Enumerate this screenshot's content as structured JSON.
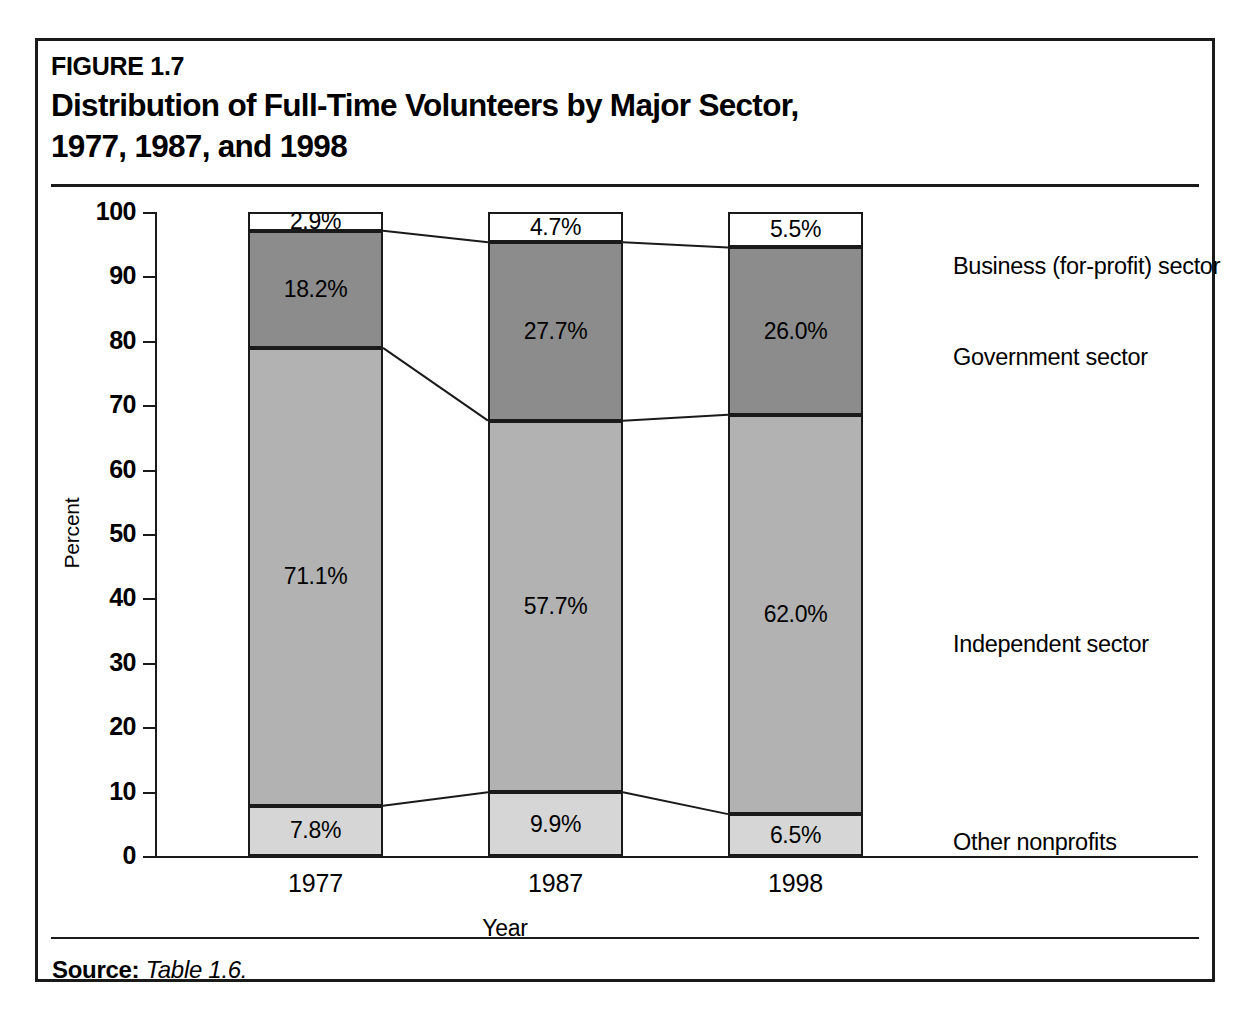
{
  "figure": {
    "number": "FIGURE 1.7",
    "title": "Distribution of Full-Time Volunteers by Major Sector, 1977, 1987, and 1998",
    "title_line1": "Distribution of Full-Time Volunteers by Major Sector,",
    "title_line2": "1977, 1987, and 1998",
    "source_label": "Source:",
    "source_value": "Table 1.6."
  },
  "chart_data": {
    "type": "bar",
    "subtype": "stacked-100-percent",
    "title": "Distribution of Full-Time Volunteers by Major Sector, 1977, 1987, and 1998",
    "xlabel": "Year",
    "ylabel": "Percent",
    "categories": [
      "1977",
      "1987",
      "1998"
    ],
    "ylim": [
      0,
      100
    ],
    "yticks": [
      0,
      10,
      20,
      30,
      40,
      50,
      60,
      70,
      80,
      90,
      100
    ],
    "ytick_labels": [
      "0",
      "10",
      "20",
      "30",
      "40",
      "50",
      "60",
      "70",
      "80",
      "90",
      "100"
    ],
    "grid": false,
    "legend_position": "right",
    "stack_order_bottom_to_top": [
      "Other nonprofits",
      "Independent sector",
      "Government sector",
      "Business (for-profit) sector"
    ],
    "series": [
      {
        "name": "Other nonprofits",
        "color": "#d6d6d6",
        "values": [
          7.8,
          9.9,
          6.5
        ],
        "labels": [
          "7.8%",
          "9.9%",
          "6.5%"
        ]
      },
      {
        "name": "Independent sector",
        "color": "#b2b2b2",
        "values": [
          71.1,
          57.7,
          62.0
        ],
        "labels": [
          "71.1%",
          "57.7%",
          "62.0%"
        ]
      },
      {
        "name": "Government sector",
        "color": "#8c8c8c",
        "values": [
          18.2,
          27.7,
          26.0
        ],
        "labels": [
          "18.2%",
          "27.7%",
          "26.0%"
        ]
      },
      {
        "name": "Business (for-profit) sector",
        "color": "#ffffff",
        "values": [
          2.9,
          4.7,
          5.5
        ],
        "labels": [
          "2.9%",
          "4.7%",
          "5.5%"
        ]
      }
    ]
  },
  "legend": {
    "items": [
      {
        "label": "Business (for-profit) sector"
      },
      {
        "label": "Government sector"
      },
      {
        "label": "Independent sector"
      },
      {
        "label": "Other nonprofits"
      }
    ]
  }
}
